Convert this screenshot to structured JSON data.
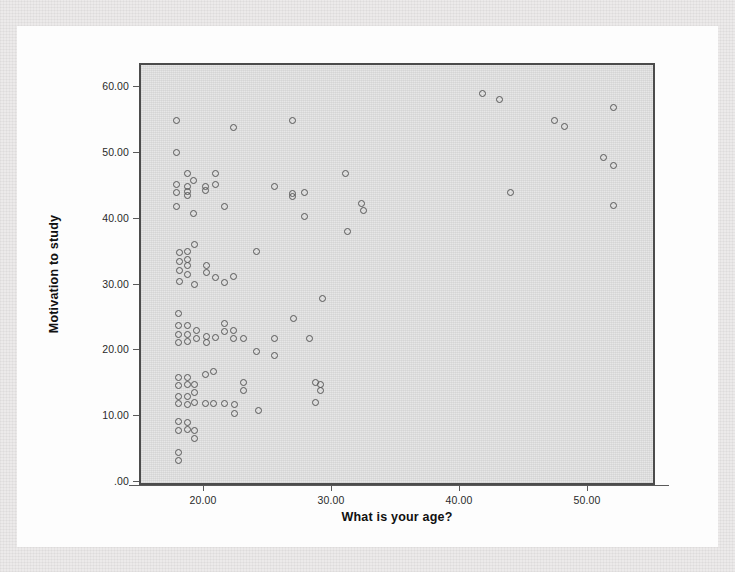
{
  "figure": {
    "background_color": "#fdfdfd",
    "plot_background_color": "#e7e7e7",
    "frame_color": "#4c4c4c",
    "marker_color": "#585858"
  },
  "chart_data": {
    "type": "scatter",
    "title": "",
    "xlabel": "What is your age?",
    "ylabel": "Motivation to study",
    "xlim": [
      15.0,
      55.0
    ],
    "ylim": [
      0.0,
      63.5
    ],
    "xticks": [
      20.0,
      30.0,
      40.0,
      50.0
    ],
    "xticklabels": [
      "20.00",
      "30.00",
      "40.00",
      "50.00"
    ],
    "yticks": [
      0.0,
      10.0,
      20.0,
      30.0,
      40.0,
      50.0,
      60.0
    ],
    "yticklabels": [
      ".00",
      "10.00",
      "20.00",
      "30.00",
      "40.00",
      "50.00",
      "60.00"
    ],
    "grid": false,
    "legend": null,
    "marker": "open-circle",
    "n_points": 120,
    "points": [
      [
        17.8,
        55.0
      ],
      [
        17.8,
        50.2
      ],
      [
        17.8,
        45.3
      ],
      [
        17.8,
        44.1
      ],
      [
        17.8,
        42.0
      ],
      [
        18.0,
        35.0
      ],
      [
        18.0,
        33.6
      ],
      [
        18.0,
        32.3
      ],
      [
        18.0,
        30.6
      ],
      [
        17.9,
        25.8
      ],
      [
        17.9,
        24.0
      ],
      [
        17.9,
        22.6
      ],
      [
        17.9,
        21.4
      ],
      [
        17.9,
        16.0
      ],
      [
        17.9,
        14.8
      ],
      [
        17.9,
        13.2
      ],
      [
        17.9,
        12.1
      ],
      [
        17.9,
        9.3
      ],
      [
        17.9,
        8.0
      ],
      [
        17.9,
        4.6
      ],
      [
        17.9,
        3.4
      ],
      [
        18.6,
        47.0
      ],
      [
        18.6,
        45.0
      ],
      [
        18.6,
        44.3
      ],
      [
        18.6,
        43.7
      ],
      [
        18.6,
        35.2
      ],
      [
        18.6,
        34.0
      ],
      [
        18.6,
        33.0
      ],
      [
        18.6,
        31.7
      ],
      [
        18.6,
        23.9
      ],
      [
        18.6,
        22.6
      ],
      [
        18.6,
        21.5
      ],
      [
        18.6,
        16.1
      ],
      [
        18.6,
        14.9
      ],
      [
        18.6,
        13.1
      ],
      [
        18.6,
        12.0
      ],
      [
        18.6,
        9.2
      ],
      [
        18.6,
        8.1
      ],
      [
        19.1,
        46.0
      ],
      [
        19.1,
        41.0
      ],
      [
        19.2,
        36.2
      ],
      [
        19.2,
        30.2
      ],
      [
        19.3,
        23.2
      ],
      [
        19.3,
        22.0
      ],
      [
        19.2,
        15.0
      ],
      [
        19.2,
        13.8
      ],
      [
        19.2,
        12.2
      ],
      [
        19.2,
        7.9
      ],
      [
        19.2,
        6.8
      ],
      [
        20.0,
        45.1
      ],
      [
        20.0,
        44.5
      ],
      [
        20.1,
        33.0
      ],
      [
        20.1,
        32.0
      ],
      [
        20.1,
        22.3
      ],
      [
        20.1,
        21.3
      ],
      [
        20.0,
        16.5
      ],
      [
        20.0,
        12.1
      ],
      [
        20.8,
        47.0
      ],
      [
        20.8,
        45.4
      ],
      [
        20.8,
        31.2
      ],
      [
        20.8,
        22.1
      ],
      [
        20.7,
        17.0
      ],
      [
        20.7,
        12.1
      ],
      [
        21.5,
        42.0
      ],
      [
        21.5,
        30.5
      ],
      [
        21.5,
        24.2
      ],
      [
        21.5,
        23.0
      ],
      [
        21.5,
        12.1
      ],
      [
        22.2,
        54.0
      ],
      [
        22.2,
        31.4
      ],
      [
        22.2,
        23.1
      ],
      [
        22.2,
        22.0
      ],
      [
        22.3,
        12.0
      ],
      [
        22.3,
        10.6
      ],
      [
        23.0,
        22.0
      ],
      [
        23.0,
        15.2
      ],
      [
        23.0,
        14.0
      ],
      [
        24.0,
        35.2
      ],
      [
        24.0,
        20.0
      ],
      [
        24.2,
        11.0
      ],
      [
        25.4,
        45.0
      ],
      [
        25.4,
        22.0
      ],
      [
        25.4,
        19.3
      ],
      [
        26.8,
        55.0
      ],
      [
        26.8,
        44.0
      ],
      [
        26.8,
        43.5
      ],
      [
        26.9,
        25.0
      ],
      [
        27.8,
        44.2
      ],
      [
        27.8,
        40.5
      ],
      [
        28.2,
        22.0
      ],
      [
        28.6,
        15.2
      ],
      [
        28.6,
        12.2
      ],
      [
        29.0,
        15.0
      ],
      [
        29.0,
        14.0
      ],
      [
        29.2,
        28.0
      ],
      [
        31.0,
        47.0
      ],
      [
        31.1,
        38.2
      ],
      [
        32.2,
        42.5
      ],
      [
        32.4,
        41.4
      ],
      [
        41.7,
        59.2
      ],
      [
        43.0,
        58.2
      ],
      [
        43.9,
        44.2
      ],
      [
        47.3,
        55.0
      ],
      [
        48.1,
        54.2
      ],
      [
        51.1,
        49.4
      ],
      [
        51.9,
        57.0
      ],
      [
        51.9,
        48.2
      ],
      [
        51.9,
        42.2
      ]
    ]
  }
}
